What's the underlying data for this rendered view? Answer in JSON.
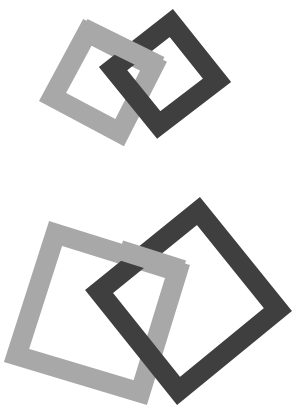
{
  "figure": {
    "colors": {
      "background": "#ffffff",
      "light_square": "#a8a8a8",
      "dark_square": "#3f3f3f"
    },
    "stroke_width": 20,
    "pairs": [
      {
        "name": "top-pair",
        "light_square": [
          [
            83,
            19
          ],
          [
            167,
            62
          ],
          [
            124,
            146
          ],
          [
            39,
            101
          ]
        ],
        "dark_square": [
          [
            173,
            9
          ],
          [
            231,
            82
          ],
          [
            157,
            139
          ],
          [
            99,
            67
          ]
        ]
      },
      {
        "name": "bottom-pair",
        "light_square": [
          [
            49,
            221
          ],
          [
            190,
            265
          ],
          [
            147,
            405
          ],
          [
            4,
            362
          ]
        ],
        "dark_square": [
          [
            200,
            197
          ],
          [
            292,
            311
          ],
          [
            177,
            405
          ],
          [
            85,
            290
          ]
        ]
      }
    ]
  }
}
